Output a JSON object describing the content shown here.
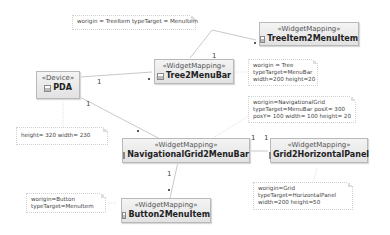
{
  "nodes": {
    "pda": {
      "stereotype": "«Device»",
      "name": "PDA"
    },
    "tree2menubar": {
      "stereotype": "«WidgetMapping»",
      "name": "Tree2MenuBar"
    },
    "treeitem2menuitem": {
      "stereotype": "«WidgetMapping»",
      "name": "TreeItem2MenuItem"
    },
    "navgrid2menubar": {
      "stereotype": "«WidgetMapping»",
      "name": "NavigationalGrid2MenuBar"
    },
    "grid2horizontalpanel": {
      "stereotype": "«WidgetMapping»",
      "name": "Grid2HorizontalPanel"
    },
    "button2menuitem": {
      "stereotype": "«WidgetMapping»",
      "name": "Button2MenuItem"
    }
  },
  "notes": {
    "treeitem": [
      "worigin = TreeItem typeTarget = MenuItem"
    ],
    "tree": [
      "worigin = Tree",
      "typeTarget=MenuBar",
      "width=200 height=20"
    ],
    "navgrid": [
      "worigin=NavigationalGrid",
      "typeTarget=MenuBar posX= 300",
      "posY= 100 width= 100 height= 20"
    ],
    "pda": [
      "height= 320 width= 230"
    ],
    "button": [
      "worigin=Button",
      "typeTarget=MenuItem"
    ],
    "grid": [
      "worigin=Grid",
      "typeTarget=HorizontalPanel",
      "width=200 height=50"
    ]
  },
  "multiplicities": {
    "pda_tree_src": "1",
    "tree_treeitem_src": "1",
    "pda_navgrid_src": "1",
    "navgrid_grid_src": "1",
    "navgrid_grid_dst": "1",
    "navgrid_button_src": "1"
  }
}
